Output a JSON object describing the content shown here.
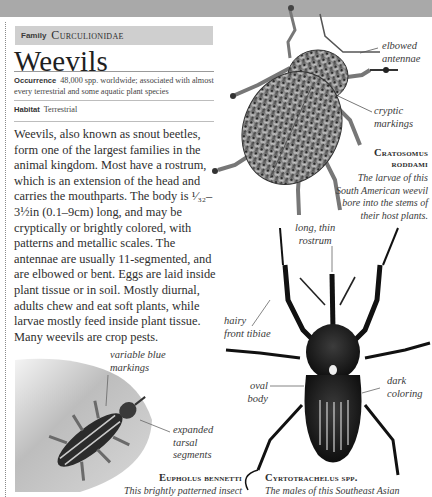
{
  "header": {
    "family_label": "Family",
    "family_name": "Curculionidae",
    "title": "Weevils"
  },
  "facts": {
    "occurrence_label": "Occurrence",
    "occurrence_value": "48,000 spp. worldwide; associated with almost every terrestrial and some aquatic plant species",
    "habitat_label": "Habitat",
    "habitat_value": "Terrestrial"
  },
  "body_text": "Weevils, also known as snout beetles, form one of the largest families in the animal kingdom. Most have a rostrum, which is an extension of the head and carries the mouthparts. The body is ¹⁄₃₂–3½in (0.1–9cm) long, and may be cryptically or brightly colored, with patterns and metallic scales. The antennae are usually 11-segmented, and are elbowed or bent. Eggs are laid inside plant tissue or in soil. Mostly diurnal, adults chew and eat soft plants, while larvae mostly feed inside plant tissue. Many weevils are crop pests.",
  "specimens": [
    {
      "name": "Cratosomus roddami",
      "name_line1": "Cratosomus",
      "name_line2": "roddami",
      "caption_lines": [
        "The larvae of this",
        "South American weevil",
        "bore into the stems of",
        "their host plants."
      ],
      "annotations": {
        "elbowed_antennae": [
          "elbowed",
          "antennae"
        ],
        "cryptic_markings": [
          "cryptic",
          "markings"
        ]
      }
    },
    {
      "name": "Cyrtotrachelus spp.",
      "caption_lines": [
        "The males of this Southeast Asian"
      ],
      "annotations": {
        "long_thin_rostrum": [
          "long, thin",
          "rostrum"
        ],
        "hairy_front_tibiae": [
          "hairy",
          "front tibiae"
        ],
        "oval_body": [
          "oval",
          "body"
        ],
        "dark_coloring": [
          "dark",
          "coloring"
        ]
      }
    },
    {
      "name": "Eupholus bennetti",
      "caption_lines": [
        "This brightly patterned insect"
      ],
      "annotations": {
        "variable_blue_markings": [
          "variable blue",
          "markings"
        ],
        "expanded_tarsal_segments": [
          "expanded",
          "tarsal",
          "segments"
        ]
      }
    }
  ],
  "colors": {
    "top_band": "#a9a9a9",
    "family_bar": "#cfcfcf",
    "text": "#2e2e2e"
  }
}
